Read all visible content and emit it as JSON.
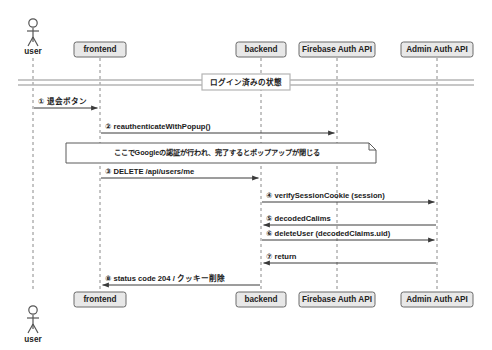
{
  "diagram": {
    "type": "uml-sequence-diagram",
    "title": "",
    "participants": [
      {
        "id": "user",
        "label": "user",
        "kind": "actor",
        "x": 33,
        "box_w": 0,
        "header_box": false,
        "footer_box": false
      },
      {
        "id": "frontend",
        "label": "frontend",
        "kind": "object",
        "x": 100,
        "box_w": 52,
        "header_box": true,
        "footer_box": true
      },
      {
        "id": "backend",
        "label": "backend",
        "kind": "object",
        "x": 261,
        "box_w": 50,
        "header_box": true,
        "footer_box": true
      },
      {
        "id": "firebase",
        "label": "Firebase Auth API",
        "kind": "object",
        "x": 337,
        "box_w": 76,
        "header_box": true,
        "footer_box": true
      },
      {
        "id": "admin",
        "label": "Admin Auth API",
        "kind": "object",
        "x": 437,
        "box_w": 72,
        "header_box": true,
        "footer_box": true
      }
    ],
    "divider": {
      "label": "ログイン済みの状態",
      "y": 82
    },
    "messages": [
      {
        "num": "①",
        "label": "① 退会ボタン",
        "from": "user",
        "to": "frontend",
        "y": 108,
        "direction": "right",
        "style": "solid"
      },
      {
        "num": "②",
        "label": "② reauthenticateWithPopup()",
        "from": "frontend",
        "to": "firebase",
        "y": 133,
        "direction": "right",
        "style": "solid"
      },
      {
        "num": "③",
        "label": "③ DELETE /api/users/me",
        "from": "frontend",
        "to": "backend",
        "y": 178,
        "direction": "right",
        "style": "solid"
      },
      {
        "num": "④",
        "label": "④ verifySessionCookie (session)",
        "from": "backend",
        "to": "admin",
        "y": 202,
        "direction": "right",
        "style": "solid"
      },
      {
        "num": "⑤",
        "label": "⑤ decodedCalims",
        "from": "admin",
        "to": "backend",
        "y": 225,
        "direction": "left",
        "style": "solid"
      },
      {
        "num": "⑥",
        "label": "⑥ deleteUser (decodedClaims.uid)",
        "from": "backend",
        "to": "admin",
        "y": 240,
        "direction": "right",
        "style": "solid"
      },
      {
        "num": "⑦",
        "label": "⑦ return",
        "from": "admin",
        "to": "backend",
        "y": 263,
        "direction": "left",
        "style": "solid"
      },
      {
        "num": "⑧",
        "label": "⑧ status code 204 / クッキー削除",
        "from": "backend",
        "to": "frontend",
        "y": 285,
        "direction": "left",
        "style": "solid"
      }
    ],
    "note": {
      "text": "ここでGoogleの認証が行われ、完了するとポップアップが閉じる",
      "x": 66,
      "y": 143,
      "w": 310,
      "h": 20,
      "fold": 7
    },
    "layout": {
      "header_box_y": 42,
      "header_box_h": 15,
      "footer_box_y": 292,
      "footer_box_h": 15,
      "lifeline_top": 58,
      "lifeline_bottom": 292,
      "actor_head_cy": 23,
      "actor_body_top": 28,
      "actor_body_bottom": 42,
      "actor_label_y": 52,
      "footer_actor_head_cy": 310,
      "footer_actor_label_y": 340
    },
    "colors": {
      "box_fill": "#e8e8e8",
      "box_stroke": "#6b6b6b",
      "lifeline": "#8a8a8a",
      "arrow": "#3a3a3a",
      "note_fill": "#ffffff",
      "note_stroke": "#5a5a5a",
      "divider_line": "#b4b4b4",
      "text": "#1a1a1a",
      "actor": "#555555"
    }
  }
}
